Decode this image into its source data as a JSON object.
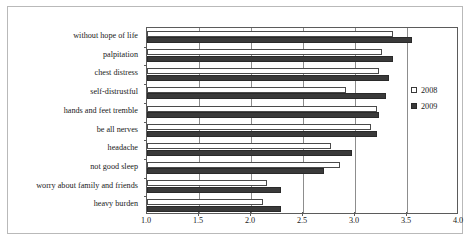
{
  "chart_data": {
    "type": "bar",
    "orientation": "horizontal",
    "title": "",
    "xlabel": "",
    "ylabel": "",
    "xlim": [
      1.0,
      4.0
    ],
    "xticks": [
      "1.0",
      "1.5",
      "2.0",
      "2.5",
      "3.0",
      "3.5",
      "4.0"
    ],
    "xtick_values": [
      1.0,
      1.5,
      2.0,
      2.5,
      3.0,
      3.5,
      4.0
    ],
    "grid": true,
    "grid_axis": "x",
    "legend_position": "right",
    "categories": [
      "without hope of life",
      "palpitation",
      "chest distress",
      "self-distrustful",
      "hands and feet tremble",
      "be all nerves",
      "headache",
      "not good sleep",
      "worry about family and friends",
      "heavy burden"
    ],
    "series": [
      {
        "name": "2008",
        "color": "#ffffff",
        "edge_color": "#4a4a4a",
        "values": [
          3.37,
          3.26,
          3.23,
          2.91,
          3.21,
          3.15,
          2.77,
          2.86,
          2.15,
          2.12
        ]
      },
      {
        "name": "2009",
        "color": "#3a3a3a",
        "edge_color": "#2a2a2a",
        "values": [
          3.55,
          3.37,
          3.33,
          3.3,
          3.23,
          3.21,
          2.97,
          2.7,
          2.29,
          2.29
        ]
      }
    ]
  },
  "legend": {
    "items": [
      {
        "label": "2008",
        "marker": "open-square-marker"
      },
      {
        "label": "2009",
        "marker": "filled-square-marker"
      }
    ]
  },
  "colors": {
    "series_2008": "#ffffff",
    "series_2009": "#3a3a3a",
    "axis": "#5b5b5b",
    "grid": "#8d8d8d",
    "frame": "#b9b9b9",
    "background": "#ffffff",
    "text": "#1a1a1a"
  }
}
